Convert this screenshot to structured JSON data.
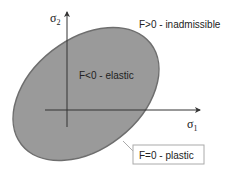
{
  "diagram": {
    "axes": {
      "x_label": "σ",
      "x_subscript": "1",
      "y_label": "σ",
      "y_subscript": "2"
    },
    "regions": {
      "outside": "F>0 - inadmissible",
      "inside": "F<0 - elastic",
      "boundary": "F=0 - plastic"
    },
    "colors": {
      "ellipse_fill": "#9a9a9a",
      "ellipse_stroke": "#6e6e6e",
      "axis": "#333333",
      "text": "#222222",
      "callout_border": "#aaaaaa",
      "leader_line": "#aaaaaa"
    }
  }
}
